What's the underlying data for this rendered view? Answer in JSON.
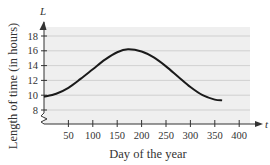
{
  "chart_data": {
    "type": "line",
    "title": "",
    "xlabel": "Day of the year",
    "ylabel": "Length of time (in hours)",
    "x_var": "t",
    "y_var": "L",
    "xlim": [
      0,
      410
    ],
    "ylim": [
      7,
      19
    ],
    "x_ticks": [
      50,
      100,
      150,
      200,
      250,
      300,
      350,
      400
    ],
    "y_ticks": [
      8,
      10,
      12,
      14,
      16,
      18
    ],
    "grid": "horizontal",
    "y_axis_break": true,
    "series": [
      {
        "name": "L(t)",
        "x": [
          0,
          25,
          50,
          75,
          100,
          125,
          150,
          172,
          200,
          225,
          250,
          275,
          300,
          325,
          350,
          365
        ],
        "y": [
          9.8,
          10.2,
          11.0,
          12.2,
          13.5,
          14.8,
          15.8,
          16.2,
          15.9,
          15.1,
          13.9,
          12.5,
          11.1,
          10.0,
          9.4,
          9.3
        ]
      }
    ],
    "colors": {
      "line": "#1a1a1a",
      "plot_bg": "#efefef",
      "grid": "#c8c8c8",
      "axis": "#333333"
    }
  }
}
